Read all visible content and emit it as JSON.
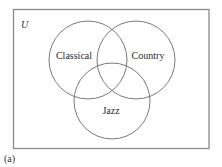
{
  "figure": {
    "caption": "(a)",
    "universe_label": "U",
    "sets": [
      {
        "label": "Classical"
      },
      {
        "label": "Country"
      },
      {
        "label": "Jazz"
      }
    ]
  },
  "colors": {
    "stroke": "#7a7a7a",
    "frame": "#8a8a8a",
    "text": "#2a2a2a",
    "background": "#ffffff"
  }
}
